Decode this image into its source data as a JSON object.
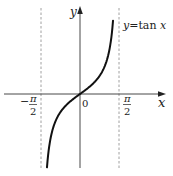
{
  "chart_data": {
    "type": "line",
    "title": "",
    "function": "y = tan x",
    "annotation": "y=tan x",
    "xlabel": "x",
    "ylabel": "y",
    "origin_label": "0",
    "x_ticks": [
      {
        "value": -1.5708,
        "label_num": "π",
        "label_den": "2",
        "sign": "−"
      },
      {
        "value": 1.5708,
        "label_num": "π",
        "label_den": "2",
        "sign": ""
      }
    ],
    "asymptotes": [
      -1.5708,
      1.5708
    ],
    "xlim": [
      -2.0,
      2.0
    ],
    "ylim": [
      -4.2,
      4.3
    ],
    "grid": false,
    "series": [
      {
        "name": "y=tan x",
        "x": [
          -1.33,
          -1.2,
          -1.0,
          -0.8,
          -0.6,
          -0.4,
          -0.2,
          0,
          0.2,
          0.4,
          0.6,
          0.8,
          1.0,
          1.2,
          1.33
        ],
        "y": [
          -4.07,
          -2.57,
          -1.56,
          -1.03,
          -0.68,
          -0.42,
          -0.2,
          0,
          0.2,
          0.42,
          0.68,
          1.03,
          1.56,
          2.57,
          4.07
        ]
      }
    ]
  },
  "labels": {
    "y_axis": "y",
    "x_axis": "x",
    "origin": "0",
    "func_y": "y",
    "func_eq": "=tan ",
    "func_x": "x",
    "neg_sign": "−",
    "pi": "π",
    "two": "2"
  },
  "colors": {
    "axis": "#333333",
    "curve": "#111111",
    "asymptote": "#888888"
  }
}
